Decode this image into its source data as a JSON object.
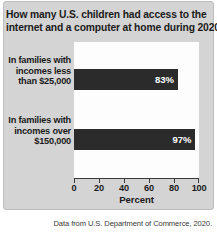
{
  "chart_data": {
    "type": "bar",
    "orientation": "horizontal",
    "title": "How many U.S. children had access to the internet and a computer at home during 2020?",
    "title_lines": [
      "How many U.S. children had access to the",
      "internet and a computer at home during 2020?"
    ],
    "categories": [
      "In families with incomes less than $25,000",
      "In families with incomes over $150,000"
    ],
    "category_lines": [
      [
        "In families with",
        "incomes less",
        "than $25,000"
      ],
      [
        "In families with",
        "incomes over",
        "$150,000"
      ]
    ],
    "values": [
      83,
      97
    ],
    "value_labels": [
      "83%",
      "97%"
    ],
    "xlabel": "Percent",
    "ylabel": "",
    "xlim": [
      0,
      100
    ],
    "xticks": [
      0,
      20,
      40,
      60,
      80,
      100
    ],
    "xtick_labels": [
      "0",
      "20",
      "40",
      "60",
      "80",
      "100"
    ],
    "grid": false,
    "legend": false,
    "bar_color": "#2b2b2b",
    "value_label_color": "#ffffff",
    "plot_background": "#fdfdfd",
    "panel_background": "#d4d4d4",
    "caption": "Data from U.S. Department of Commerce, 2020."
  }
}
